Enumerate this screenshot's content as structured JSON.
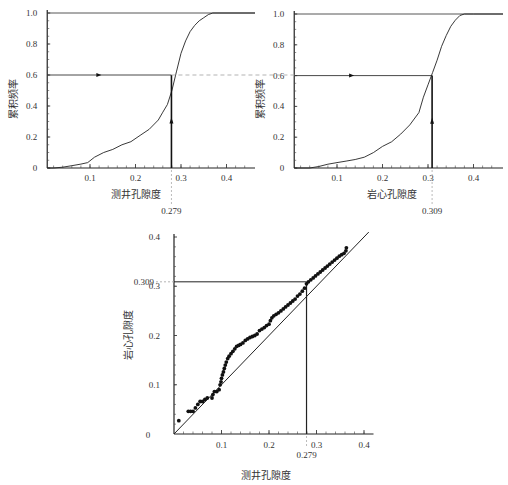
{
  "chart_data": [
    {
      "id": "cdf-log",
      "type": "line",
      "xlabel": "测井孔隙度",
      "ylabel": "累积频率",
      "xlim": [
        0,
        0.46
      ],
      "ylim": [
        0,
        1.0
      ],
      "xticks": [
        0.1,
        0.2,
        0.3,
        0.4
      ],
      "xtick_labels": [
        "0.1",
        "0.2",
        "0.3",
        "0.4"
      ],
      "yticks": [
        0,
        0.2,
        0.4,
        0.6,
        0.8,
        1.0
      ],
      "ytick_labels": [
        "0",
        "0.2",
        "0.4",
        "0.6",
        "0.8",
        "1.0"
      ],
      "grid": false,
      "series": [
        {
          "name": "cumulative-frequency",
          "x": [
            0.02,
            0.04,
            0.06,
            0.08,
            0.095,
            0.11,
            0.13,
            0.15,
            0.17,
            0.19,
            0.21,
            0.23,
            0.25,
            0.26,
            0.27,
            0.28,
            0.29,
            0.3,
            0.31,
            0.32,
            0.33,
            0.34,
            0.35,
            0.36,
            0.37
          ],
          "y": [
            0.0,
            0.005,
            0.015,
            0.025,
            0.035,
            0.07,
            0.1,
            0.12,
            0.15,
            0.17,
            0.21,
            0.25,
            0.31,
            0.36,
            0.41,
            0.5,
            0.62,
            0.74,
            0.82,
            0.88,
            0.92,
            0.95,
            0.97,
            0.99,
            1.0
          ]
        }
      ],
      "reference": {
        "frequency": 0.6,
        "value": 0.279,
        "value_label": "0.279"
      }
    },
    {
      "id": "cdf-core",
      "type": "line",
      "xlabel": "岩心孔隙度",
      "ylabel": "累积频率",
      "xlim": [
        0,
        0.46
      ],
      "ylim": [
        0,
        1.0
      ],
      "xticks": [
        0.1,
        0.2,
        0.3,
        0.4
      ],
      "xtick_labels": [
        "0.1",
        "0.2",
        "0.3",
        "0.4"
      ],
      "yticks": [
        0,
        0.2,
        0.4,
        0.6,
        0.8,
        1.0
      ],
      "ytick_labels": [
        "0",
        "0.2",
        "0.4",
        "0.6",
        "0.8",
        "1.0"
      ],
      "grid": false,
      "series": [
        {
          "name": "cumulative-frequency",
          "x": [
            0.04,
            0.06,
            0.08,
            0.1,
            0.12,
            0.14,
            0.16,
            0.18,
            0.2,
            0.22,
            0.24,
            0.26,
            0.28,
            0.29,
            0.3,
            0.31,
            0.32,
            0.33,
            0.34,
            0.35,
            0.36,
            0.37,
            0.38,
            0.4
          ],
          "y": [
            0.0,
            0.01,
            0.025,
            0.035,
            0.045,
            0.055,
            0.07,
            0.1,
            0.14,
            0.17,
            0.22,
            0.28,
            0.36,
            0.46,
            0.54,
            0.62,
            0.7,
            0.79,
            0.86,
            0.92,
            0.96,
            0.99,
            1.0,
            1.0
          ]
        }
      ],
      "reference": {
        "frequency": 0.6,
        "value": 0.309,
        "value_label": "0.309"
      }
    },
    {
      "id": "qq-plot",
      "type": "scatter",
      "xlabel": "测井孔隙度",
      "ylabel": "岩心孔隙度",
      "xlim": [
        0,
        0.42
      ],
      "ylim": [
        0,
        0.4
      ],
      "xticks": [
        0.1,
        0.2,
        0.3,
        0.4
      ],
      "xtick_labels": [
        "0.1",
        "0.2",
        "0.3",
        "0.4"
      ],
      "yticks": [
        0.1,
        0.2,
        0.3,
        0.4
      ],
      "ytick_labels": [
        "0.1",
        "0.2",
        "0.3",
        "0.4"
      ],
      "origin_label": "0",
      "grid": false,
      "diagonal": {
        "from": [
          0,
          0
        ],
        "to": [
          0.41,
          0.41
        ]
      },
      "reference": {
        "x": 0.279,
        "y": 0.309,
        "x_label": "0.279",
        "y_label": "0.309"
      },
      "points": [
        [
          0.01,
          0.027
        ],
        [
          0.03,
          0.046
        ],
        [
          0.035,
          0.046
        ],
        [
          0.04,
          0.046
        ],
        [
          0.045,
          0.053
        ],
        [
          0.05,
          0.06
        ],
        [
          0.055,
          0.066
        ],
        [
          0.06,
          0.066
        ],
        [
          0.065,
          0.07
        ],
        [
          0.07,
          0.073
        ],
        [
          0.08,
          0.073
        ],
        [
          0.082,
          0.08
        ],
        [
          0.085,
          0.086
        ],
        [
          0.09,
          0.086
        ],
        [
          0.095,
          0.09
        ],
        [
          0.097,
          0.1
        ],
        [
          0.099,
          0.106
        ],
        [
          0.1,
          0.113
        ],
        [
          0.102,
          0.12
        ],
        [
          0.104,
          0.126
        ],
        [
          0.106,
          0.133
        ],
        [
          0.108,
          0.14
        ],
        [
          0.11,
          0.146
        ],
        [
          0.113,
          0.153
        ],
        [
          0.116,
          0.158
        ],
        [
          0.12,
          0.163
        ],
        [
          0.124,
          0.168
        ],
        [
          0.128,
          0.173
        ],
        [
          0.132,
          0.178
        ],
        [
          0.136,
          0.18
        ],
        [
          0.14,
          0.182
        ],
        [
          0.145,
          0.185
        ],
        [
          0.15,
          0.19
        ],
        [
          0.155,
          0.193
        ],
        [
          0.16,
          0.196
        ],
        [
          0.165,
          0.198
        ],
        [
          0.17,
          0.2
        ],
        [
          0.175,
          0.203
        ],
        [
          0.18,
          0.21
        ],
        [
          0.185,
          0.213
        ],
        [
          0.19,
          0.216
        ],
        [
          0.195,
          0.22
        ],
        [
          0.2,
          0.223
        ],
        [
          0.203,
          0.23
        ],
        [
          0.206,
          0.236
        ],
        [
          0.21,
          0.24
        ],
        [
          0.215,
          0.243
        ],
        [
          0.22,
          0.246
        ],
        [
          0.225,
          0.25
        ],
        [
          0.23,
          0.254
        ],
        [
          0.235,
          0.258
        ],
        [
          0.24,
          0.262
        ],
        [
          0.245,
          0.266
        ],
        [
          0.25,
          0.27
        ],
        [
          0.255,
          0.274
        ],
        [
          0.26,
          0.28
        ],
        [
          0.265,
          0.284
        ],
        [
          0.27,
          0.29
        ],
        [
          0.275,
          0.296
        ],
        [
          0.279,
          0.305
        ],
        [
          0.283,
          0.309
        ],
        [
          0.288,
          0.313
        ],
        [
          0.293,
          0.317
        ],
        [
          0.298,
          0.321
        ],
        [
          0.303,
          0.325
        ],
        [
          0.308,
          0.329
        ],
        [
          0.313,
          0.333
        ],
        [
          0.318,
          0.337
        ],
        [
          0.323,
          0.341
        ],
        [
          0.328,
          0.345
        ],
        [
          0.333,
          0.349
        ],
        [
          0.338,
          0.353
        ],
        [
          0.343,
          0.357
        ],
        [
          0.348,
          0.361
        ],
        [
          0.353,
          0.364
        ],
        [
          0.358,
          0.367
        ],
        [
          0.362,
          0.372
        ],
        [
          0.363,
          0.378
        ]
      ]
    }
  ]
}
